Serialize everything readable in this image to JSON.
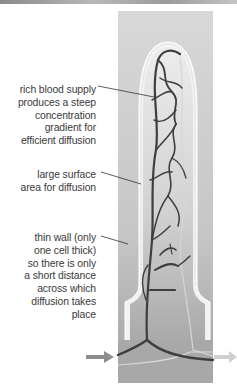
{
  "diagram": {
    "labels": [
      {
        "id": "rich-blood-supply",
        "text": "rich blood supply\nproduces a steep\nconcentration\ngradient for\nefficient diffusion"
      },
      {
        "id": "large-surface-area",
        "text": "large surface\narea for diffusion"
      },
      {
        "id": "thin-wall",
        "text": "thin wall (only\none cell thick)\nso there is only\na short distance\nacross which\ndiffusion takes\nplace"
      }
    ],
    "arrows": [
      {
        "id": "blood-in-arrow",
        "direction": "right"
      },
      {
        "id": "blood-out-arrow",
        "direction": "right"
      }
    ],
    "colors": {
      "panel_top": "#d8d8d8",
      "panel_bottom": "#a6a6a6",
      "villus_fill_top": "#e6e6e6",
      "villus_fill_bottom": "#b4b4b4",
      "wall_outline": "#f4f4f4",
      "capillary": "#3e3e3e",
      "vein_light": "#d2d2d2",
      "leader_line": "#333333",
      "text": "#3a3a3a"
    }
  }
}
